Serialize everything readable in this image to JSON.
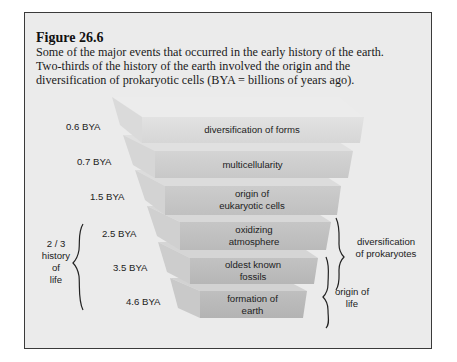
{
  "figure": {
    "title": "Figure 26.6",
    "caption_lines": [
      "Some of the major events that occurred in the early history of the earth.",
      "Two-thirds of the history of the earth involved the origin and the",
      "diversification of prokaryotic cells (BYA = billions of years ago)."
    ]
  },
  "events": [
    {
      "time": "0.6 BYA",
      "line1": "diversification of forms",
      "line2": ""
    },
    {
      "time": "0.7 BYA",
      "line1": "multicellularity",
      "line2": ""
    },
    {
      "time": "1.5 BYA",
      "line1": "origin of",
      "line2": "eukaryotic cells"
    },
    {
      "time": "2.5 BYA",
      "line1": "oxidizing",
      "line2": "atmosphere"
    },
    {
      "time": "3.5 BYA",
      "line1": "oldest known",
      "line2": "fossils"
    },
    {
      "time": "4.6 BYA",
      "line1": "formation of",
      "line2": "earth"
    }
  ],
  "brackets": {
    "left": {
      "lines": [
        "2 / 3",
        "history",
        "of",
        "life"
      ]
    },
    "right_upper": {
      "lines": [
        "diversification",
        "of prokaryotes"
      ]
    },
    "right_lower": {
      "lines": [
        "origin of",
        "life"
      ]
    }
  }
}
